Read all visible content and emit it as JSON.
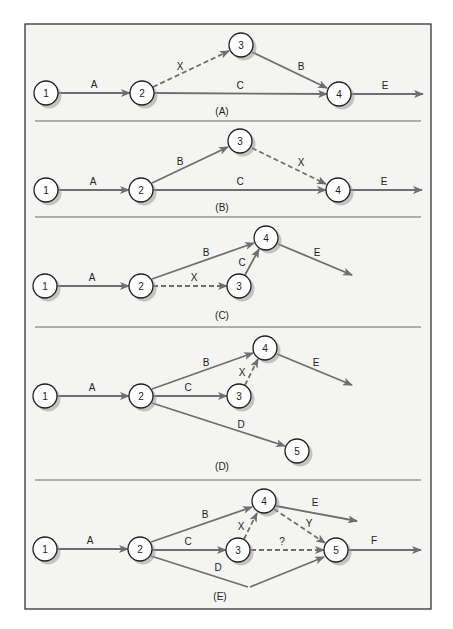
{
  "diagram": {
    "colors": {
      "frame_bg": "#f4f4f2",
      "arrow": "#6e6e6e",
      "node_border": "#222222"
    },
    "frame": {
      "x": 25,
      "y": 24,
      "w": 406,
      "h": 585
    },
    "dividers": [
      121,
      217,
      327,
      480
    ],
    "panels": [
      {
        "label": "(A)",
        "label_pos": [
          222,
          115
        ],
        "nodes": [
          {
            "id": "1",
            "x": 46,
            "y": 93
          },
          {
            "id": "2",
            "x": 142,
            "y": 93
          },
          {
            "id": "3",
            "x": 241,
            "y": 45
          },
          {
            "id": "4",
            "x": 339,
            "y": 94
          }
        ],
        "edges": [
          {
            "label": "A",
            "from": [
              58,
              93
            ],
            "to": [
              130,
              93
            ],
            "lpos": [
              94,
              88
            ],
            "dashed": false
          },
          {
            "label": "X",
            "from": [
              153,
              87
            ],
            "to": [
              229,
              51
            ],
            "lpos": [
              180,
              70
            ],
            "dashed": true
          },
          {
            "label": "B",
            "from": [
              252,
              52
            ],
            "to": [
              327,
              88
            ],
            "lpos": [
              301,
              70
            ],
            "dashed": false
          },
          {
            "label": "C",
            "from": [
              154,
              93
            ],
            "to": [
              327,
              94
            ],
            "lpos": [
              240,
              89
            ],
            "dashed": false
          },
          {
            "label": "E",
            "from": [
              351,
              94
            ],
            "to": [
              423,
              94
            ],
            "lpos": [
              385,
              89
            ],
            "dashed": false
          }
        ]
      },
      {
        "label": "(B)",
        "label_pos": [
          222,
          211
        ],
        "nodes": [
          {
            "id": "1",
            "x": 46,
            "y": 190
          },
          {
            "id": "2",
            "x": 141,
            "y": 190
          },
          {
            "id": "3",
            "x": 240,
            "y": 141
          },
          {
            "id": "4",
            "x": 338,
            "y": 190
          }
        ],
        "edges": [
          {
            "label": "A",
            "from": [
              58,
              190
            ],
            "to": [
              129,
              190
            ],
            "lpos": [
              93,
              185
            ],
            "dashed": false
          },
          {
            "label": "B",
            "from": [
              152,
              183
            ],
            "to": [
              228,
              147
            ],
            "lpos": [
              180,
              165
            ],
            "dashed": false
          },
          {
            "label": "X",
            "from": [
              252,
              148
            ],
            "to": [
              326,
              184
            ],
            "lpos": [
              301,
              166
            ],
            "dashed": true
          },
          {
            "label": "C",
            "from": [
              153,
              190
            ],
            "to": [
              326,
              190
            ],
            "lpos": [
              240,
              185
            ],
            "dashed": false
          },
          {
            "label": "E",
            "from": [
              350,
              190
            ],
            "to": [
              422,
              190
            ],
            "lpos": [
              384,
              185
            ],
            "dashed": false
          }
        ]
      },
      {
        "label": "(C)",
        "label_pos": [
          222,
          319
        ],
        "nodes": [
          {
            "id": "1",
            "x": 45,
            "y": 286
          },
          {
            "id": "2",
            "x": 141,
            "y": 286
          },
          {
            "id": "3",
            "x": 239,
            "y": 286
          },
          {
            "id": "4",
            "x": 266,
            "y": 238
          }
        ],
        "edges": [
          {
            "label": "A",
            "from": [
              57,
              286
            ],
            "to": [
              129,
              286
            ],
            "lpos": [
              92,
              281
            ],
            "dashed": false
          },
          {
            "label": "B",
            "from": [
              152,
              279
            ],
            "to": [
              254,
              243
            ],
            "lpos": [
              206,
              256
            ],
            "dashed": false
          },
          {
            "label": "X",
            "from": [
              153,
              286
            ],
            "to": [
              227,
              286
            ],
            "lpos": [
              194,
              281
            ],
            "dashed": true
          },
          {
            "label": "C",
            "from": [
              245,
              275
            ],
            "to": [
              259,
              249
            ],
            "lpos": [
              242,
              266
            ],
            "dashed": false
          },
          {
            "label": "E",
            "from": [
              278,
              244
            ],
            "to": [
              352,
              275
            ],
            "lpos": [
              317,
              256
            ],
            "dashed": false
          }
        ]
      },
      {
        "label": "(D)",
        "label_pos": [
          222,
          470
        ],
        "nodes": [
          {
            "id": "1",
            "x": 45,
            "y": 396
          },
          {
            "id": "2",
            "x": 141,
            "y": 396
          },
          {
            "id": "3",
            "x": 239,
            "y": 396
          },
          {
            "id": "4",
            "x": 265,
            "y": 348
          },
          {
            "id": "5",
            "x": 297,
            "y": 451
          }
        ],
        "edges": [
          {
            "label": "A",
            "from": [
              57,
              396
            ],
            "to": [
              129,
              396
            ],
            "lpos": [
              92,
              391
            ],
            "dashed": false
          },
          {
            "label": "B",
            "from": [
              152,
              389
            ],
            "to": [
              253,
              353
            ],
            "lpos": [
              206,
              366
            ],
            "dashed": false
          },
          {
            "label": "C",
            "from": [
              153,
              396
            ],
            "to": [
              227,
              396
            ],
            "lpos": [
              188,
              391
            ],
            "dashed": false
          },
          {
            "label": "X",
            "from": [
              245,
              385
            ],
            "to": [
              258,
              359
            ],
            "lpos": [
              242,
              376
            ],
            "dashed": true
          },
          {
            "label": "E",
            "from": [
              277,
              354
            ],
            "to": [
              352,
              385
            ],
            "lpos": [
              316,
              366
            ],
            "dashed": false
          },
          {
            "label": "D",
            "from": [
              152,
              403
            ],
            "to": [
              285,
              446
            ],
            "lpos": [
              241,
              428
            ],
            "dashed": false
          }
        ]
      },
      {
        "label": "(E)",
        "label_pos": [
          220,
          600
        ],
        "nodes": [
          {
            "id": "1",
            "x": 45,
            "y": 549
          },
          {
            "id": "2",
            "x": 140,
            "y": 549
          },
          {
            "id": "3",
            "x": 238,
            "y": 550
          },
          {
            "id": "4",
            "x": 264,
            "y": 501
          },
          {
            "id": "5",
            "x": 336,
            "y": 550
          }
        ],
        "edges": [
          {
            "label": "A",
            "from": [
              57,
              549
            ],
            "to": [
              128,
              549
            ],
            "lpos": [
              90,
              544
            ],
            "dashed": false
          },
          {
            "label": "B",
            "from": [
              151,
              542
            ],
            "to": [
              252,
              507
            ],
            "lpos": [
              205,
              518
            ],
            "dashed": false
          },
          {
            "label": "C",
            "from": [
              152,
              550
            ],
            "to": [
              226,
              550
            ],
            "lpos": [
              188,
              545
            ],
            "dashed": false
          },
          {
            "label": "X",
            "from": [
              244,
              539
            ],
            "to": [
              257,
              513
            ],
            "lpos": [
              241,
              530
            ],
            "dashed": true
          },
          {
            "label": "E",
            "from": [
              276,
              506
            ],
            "to": [
              357,
              521
            ],
            "lpos": [
              315,
              506
            ],
            "dashed": false
          },
          {
            "label": "Y",
            "from": [
              274,
              509
            ],
            "to": [
              325,
              543
            ],
            "lpos": [
              309,
              527
            ],
            "dashed": true
          },
          {
            "label": "?",
            "from": [
              251,
              550
            ],
            "to": [
              324,
              550
            ],
            "lpos": [
              282,
              545
            ],
            "dashed": true
          },
          {
            "label": "F",
            "from": [
              348,
              550
            ],
            "to": [
              421,
              550
            ],
            "lpos": [
              374,
              544
            ],
            "dashed": false
          },
          {
            "label": "D",
            "from": [
              151,
              556
            ],
            "to": [
              248,
              587
            ],
            "lpos": [
              218,
              571
            ],
            "dashed": false,
            "noarrow": true
          },
          {
            "label": "",
            "from": [
              250,
              587
            ],
            "to": [
              324,
              557
            ],
            "lpos": [
              0,
              0
            ],
            "dashed": false
          }
        ]
      }
    ]
  }
}
